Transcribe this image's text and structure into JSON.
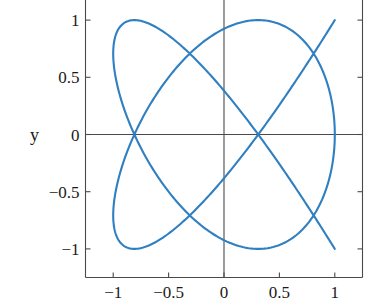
{
  "chart_data": {
    "type": "line",
    "title": "",
    "subtitle": "",
    "xlabel": "",
    "ylabel": "y",
    "xlim": [
      -1.25,
      1.25
    ],
    "ylim": [
      -1.25,
      1.25
    ],
    "grid": false,
    "legend": null,
    "legend_position": "none",
    "x_ticks": [
      -1,
      -0.5,
      0,
      0.5,
      1
    ],
    "x_tick_labels": [
      "−1",
      "−0.5",
      "0",
      "0.5",
      "1"
    ],
    "y_ticks": [
      1,
      0.5,
      0,
      -0.5,
      -1
    ],
    "y_tick_labels": [
      "1",
      "0.5",
      "0",
      "−0.5",
      "−1"
    ],
    "axis_color": "#4a4a4a",
    "zero_axis_color": "#4a4a4a",
    "series": [
      {
        "name": "lissajous",
        "color": "#2f7fc1",
        "line_width": 2.1,
        "description": "Lissajous curve, frequency ratio 5:4",
        "parametric": {
          "x_expr": "cos(4*t)",
          "y_expr": "sin(5*t)",
          "x_amplitude": 1.0,
          "y_amplitude": 1.0,
          "x_frequency": 4,
          "y_frequency": 5,
          "phase": 0,
          "t_start": 0,
          "t_end": 6.283185307179586,
          "samples": 1400
        }
      }
    ],
    "annotations": []
  },
  "axes": {
    "y_axis_label": "y"
  }
}
